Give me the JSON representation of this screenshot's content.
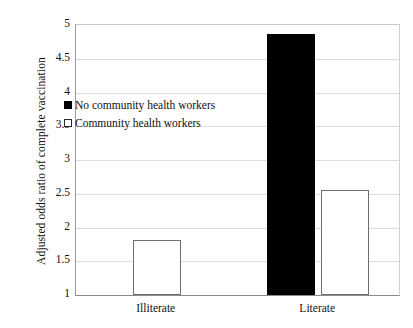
{
  "chart_data": {
    "type": "bar",
    "title": "",
    "subtitle": "",
    "xlabel": "",
    "ylabel": "Adjusted odds ratio of complete vaccination",
    "categories": [
      "Illiterate",
      "Literate"
    ],
    "ylim": [
      1,
      5
    ],
    "ytick_labels": [
      "5",
      "4.5",
      "4",
      "3.5",
      "3",
      "2.5",
      "2",
      "1.5",
      "1"
    ],
    "ytick_values": [
      5,
      4.5,
      4,
      3.5,
      3,
      2.5,
      2,
      1.5,
      1
    ],
    "grid": true,
    "grid_axis": "y",
    "legend_position": "inside-top-left",
    "series": [
      {
        "name": "No community health workers",
        "style": "filled",
        "color": "#000000",
        "values": [
          null,
          4.86
        ]
      },
      {
        "name": "Community health workers",
        "style": "hollow",
        "color": "#ffffff",
        "edge_color": "#6f6f6f",
        "values": [
          1.81,
          2.56
        ]
      }
    ]
  },
  "axis": {
    "y_title": "Adjusted odds ratio of complete vaccination",
    "ticks": [
      {
        "label": "5",
        "value": 5
      },
      {
        "label": "4.5",
        "value": 4.5
      },
      {
        "label": "4",
        "value": 4
      },
      {
        "label": "3.5",
        "value": 3.5
      },
      {
        "label": "3",
        "value": 3
      },
      {
        "label": "2.5",
        "value": 2.5
      },
      {
        "label": "2",
        "value": 2
      },
      {
        "label": "1.5",
        "value": 1.5
      },
      {
        "label": "1",
        "value": 1
      }
    ]
  },
  "categories": [
    {
      "label": "Illiterate"
    },
    {
      "label": "Literate"
    }
  ],
  "legend": {
    "items": [
      {
        "label": "No community health workers",
        "style": "filled"
      },
      {
        "label": "Community health workers",
        "style": "hollow"
      }
    ]
  },
  "colors": {
    "bar_filled": "#000000",
    "bar_hollow_fill": "#ffffff",
    "bar_hollow_edge": "#6f6f6f",
    "gridline": "#dedede",
    "axis": "#8a8a8a",
    "text": "#111111",
    "background": "#ffffff"
  }
}
